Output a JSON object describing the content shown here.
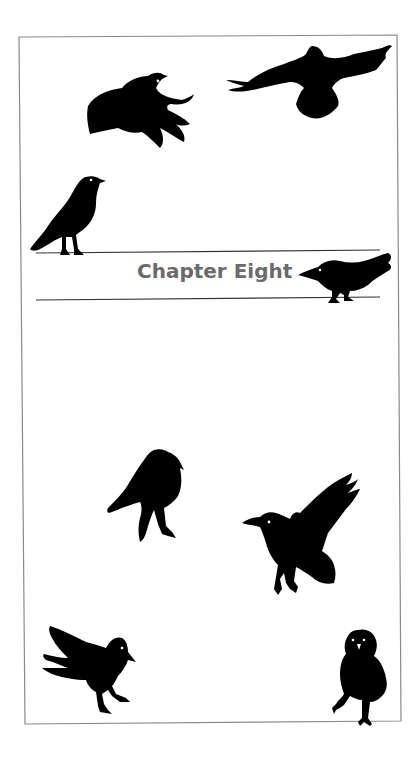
{
  "page": {
    "chapter_title": "Chapter Eight",
    "colors": {
      "background": "#ffffff",
      "frame_border": "#8a8a8a",
      "rule_lines": "#333333",
      "title_text": "#6a6a6a",
      "silhouettes": "#000000"
    },
    "illustrations": [
      {
        "name": "crow-flying-left-top",
        "pose": "flying, wings down"
      },
      {
        "name": "crow-soaring-top-right",
        "pose": "soaring, wings spread"
      },
      {
        "name": "crow-perched-on-line",
        "pose": "standing on upper rule"
      },
      {
        "name": "crow-crouching-on-line",
        "pose": "crouching on lower rule beside title"
      },
      {
        "name": "crow-standing-hunched",
        "pose": "standing, hunched"
      },
      {
        "name": "crow-landing-wing-raised",
        "pose": "landing, wing raised"
      },
      {
        "name": "crow-walking-bottom-left",
        "pose": "walking, tail raised"
      },
      {
        "name": "crow-stepping-bottom-right",
        "pose": "stepping forward, facing viewer"
      }
    ]
  }
}
